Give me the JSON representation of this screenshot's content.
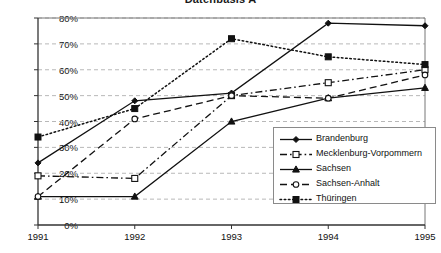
{
  "chart_data": {
    "type": "line",
    "title": "Datenbasis A",
    "xlabel": "",
    "ylabel": "",
    "x": [
      "1991",
      "1992",
      "1993",
      "1994",
      "1995"
    ],
    "categories": [
      "1991",
      "1992",
      "1993",
      "1994",
      "1995"
    ],
    "ylim": [
      0,
      80
    ],
    "ytick_labels": [
      "0%",
      "10%",
      "20%",
      "30%",
      "40%",
      "50%",
      "60%",
      "70%",
      "80%"
    ],
    "ytick_values": [
      0,
      10,
      20,
      30,
      40,
      50,
      60,
      70,
      80
    ],
    "grid": "horizontal-dashed",
    "legend_position": "inside-right-lower",
    "series": [
      {
        "name": "Brandenburg",
        "values": [
          24,
          48,
          51,
          78,
          77
        ],
        "marker": "filled-diamond",
        "line_style": "solid"
      },
      {
        "name": "Mecklenburg-Vorpommern",
        "values": [
          19,
          18,
          50,
          55,
          60
        ],
        "marker": "open-square",
        "line_style": "dash-dot"
      },
      {
        "name": "Sachsen",
        "values": [
          11,
          11,
          40,
          49,
          53
        ],
        "marker": "filled-triangle",
        "line_style": "solid"
      },
      {
        "name": "Sachsen-Anhalt",
        "values": [
          11,
          41,
          50,
          49,
          58
        ],
        "marker": "open-circle",
        "line_style": "dashed"
      },
      {
        "name": "Thüringen",
        "values": [
          34,
          45,
          72,
          65,
          62
        ],
        "marker": "filled-square",
        "line_style": "dotted"
      }
    ]
  },
  "colors": {
    "line": "#111111",
    "grid": "#b8b8b8",
    "axis": "#444444",
    "background": "#ffffff"
  }
}
